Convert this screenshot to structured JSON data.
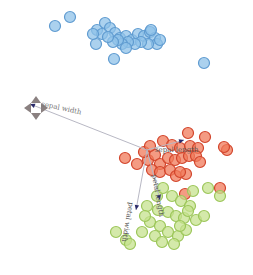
{
  "chart_data": {
    "type": "scatter",
    "title": "",
    "xlabel": "",
    "ylabel": "",
    "grid": false,
    "legend": null,
    "series": [
      {
        "name": "setosa",
        "color": "#8fc1e8",
        "stroke": "#5f9bd0",
        "points": [
          [
            55,
            26
          ],
          [
            70,
            17
          ],
          [
            97,
            30
          ],
          [
            105,
            23
          ],
          [
            110,
            28
          ],
          [
            102,
            34
          ],
          [
            115,
            33
          ],
          [
            120,
            38
          ],
          [
            126,
            36
          ],
          [
            132,
            40
          ],
          [
            138,
            34
          ],
          [
            144,
            36
          ],
          [
            150,
            32
          ],
          [
            155,
            38
          ],
          [
            157,
            44
          ],
          [
            148,
            44
          ],
          [
            141,
            42
          ],
          [
            135,
            44
          ],
          [
            128,
            42
          ],
          [
            122,
            44
          ],
          [
            118,
            40
          ],
          [
            113,
            42
          ],
          [
            108,
            37
          ],
          [
            96,
            44
          ],
          [
            93,
            34
          ],
          [
            126,
            48
          ],
          [
            114,
            59
          ],
          [
            204,
            63
          ],
          [
            151,
            30
          ],
          [
            160,
            40
          ]
        ]
      },
      {
        "name": "versicolor",
        "color": "#f07a5a",
        "stroke": "#d2452c",
        "points": [
          [
            188,
            133
          ],
          [
            205,
            137
          ],
          [
            227,
            150
          ],
          [
            224,
            147
          ],
          [
            163,
            141
          ],
          [
            172,
            145
          ],
          [
            180,
            148
          ],
          [
            190,
            146
          ],
          [
            198,
            148
          ],
          [
            125,
            158
          ],
          [
            137,
            164
          ],
          [
            148,
            160
          ],
          [
            155,
            155
          ],
          [
            160,
            164
          ],
          [
            168,
            158
          ],
          [
            175,
            160
          ],
          [
            182,
            158
          ],
          [
            189,
            156
          ],
          [
            196,
            156
          ],
          [
            200,
            162
          ],
          [
            152,
            170
          ],
          [
            160,
            172
          ],
          [
            170,
            170
          ],
          [
            176,
            176
          ],
          [
            186,
            174
          ],
          [
            144,
            152
          ],
          [
            150,
            146
          ],
          [
            180,
            172
          ],
          [
            185,
            194
          ],
          [
            220,
            188
          ]
        ]
      },
      {
        "name": "virginica",
        "color": "#c5e28e",
        "stroke": "#9cc65a",
        "points": [
          [
            193,
            191
          ],
          [
            208,
            188
          ],
          [
            220,
            196
          ],
          [
            147,
            206
          ],
          [
            157,
            196
          ],
          [
            163,
            188
          ],
          [
            172,
            196
          ],
          [
            181,
            201
          ],
          [
            190,
            206
          ],
          [
            168,
            212
          ],
          [
            176,
            216
          ],
          [
            184,
            218
          ],
          [
            196,
            220
          ],
          [
            204,
            216
          ],
          [
            150,
            222
          ],
          [
            160,
            226
          ],
          [
            142,
            232
          ],
          [
            155,
            236
          ],
          [
            168,
            232
          ],
          [
            178,
            236
          ],
          [
            186,
            230
          ],
          [
            116,
            232
          ],
          [
            126,
            240
          ],
          [
            130,
            244
          ],
          [
            174,
            244
          ],
          [
            162,
            242
          ],
          [
            158,
            210
          ],
          [
            145,
            216
          ],
          [
            180,
            226
          ],
          [
            188,
            211
          ]
        ]
      }
    ],
    "loadings": [
      {
        "name": "sepal length",
        "x1": 147,
        "y1": 150,
        "x2": 184,
        "y2": 140
      },
      {
        "name": "sepal width",
        "x1": 147,
        "y1": 150,
        "x2": 30,
        "y2": 104
      },
      {
        "name": "petal length",
        "x1": 147,
        "y1": 150,
        "x2": 160,
        "y2": 200
      },
      {
        "name": "petal width",
        "x1": 147,
        "y1": 150,
        "x2": 136,
        "y2": 210
      }
    ],
    "annotations": [
      "sepal length",
      "sepal width",
      "petal length",
      "petal width"
    ]
  },
  "labels": {
    "sepal_length": "sepal length",
    "sepal_width": "sepal width",
    "petal_length": "petal length",
    "petal_width": "petal width"
  }
}
